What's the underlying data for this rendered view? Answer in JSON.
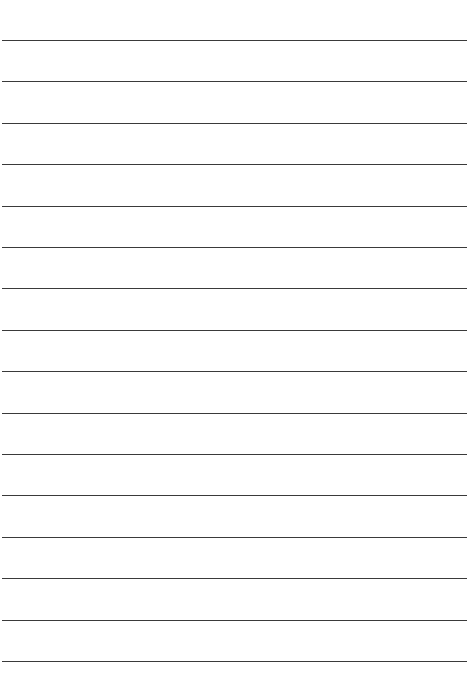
{
  "page": {
    "type": "lined-paper",
    "background_color": "#ffffff",
    "line_color": "#3a3a3a",
    "line_count": 16,
    "first_line_y": 40,
    "line_spacing": 41.4
  }
}
